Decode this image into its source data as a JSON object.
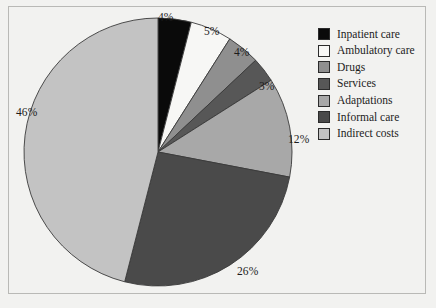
{
  "chart_data": {
    "type": "pie",
    "title": "",
    "subtitle": "",
    "xlabel": "",
    "ylabel": "",
    "legend_position": "right",
    "grid": false,
    "start_angle_deg": 0,
    "direction": "clockwise",
    "categories": [
      "Inpatient care",
      "Ambulatory care",
      "Drugs",
      "Services",
      "Adaptations",
      "Informal care",
      "Indirect costs"
    ],
    "values": [
      4,
      5,
      4,
      3,
      12,
      26,
      46
    ],
    "value_labels": [
      "4%",
      "5%",
      "4%",
      "3%",
      "12%",
      "26%",
      "46%"
    ],
    "colors": [
      "#0a0a0a",
      "#f7f7f5",
      "#8f8f8f",
      "#575757",
      "#a8a8a8",
      "#4a4a4a",
      "#c3c3c3"
    ],
    "slice_border_color": "#3a3a3a",
    "units": "percent"
  },
  "legend": {
    "items": [
      {
        "label": "Inpatient care",
        "color": "#0a0a0a"
      },
      {
        "label": "Ambulatory care",
        "color": "#f7f7f5"
      },
      {
        "label": "Drugs",
        "color": "#8f8f8f"
      },
      {
        "label": "Services",
        "color": "#575757"
      },
      {
        "label": "Adaptations",
        "color": "#a8a8a8"
      },
      {
        "label": "Informal care",
        "color": "#4a4a4a"
      },
      {
        "label": "Indirect costs",
        "color": "#c3c3c3"
      }
    ]
  },
  "labels": {
    "inpatient": "4%",
    "ambulatory": "5%",
    "drugs": "4%",
    "services": "3%",
    "adaptations": "12%",
    "informal": "26%",
    "indirect": "46%"
  },
  "theme": {
    "background": "#f2f2f0",
    "frame_border": "#b9b9b6",
    "text": "#1c1c1c"
  }
}
